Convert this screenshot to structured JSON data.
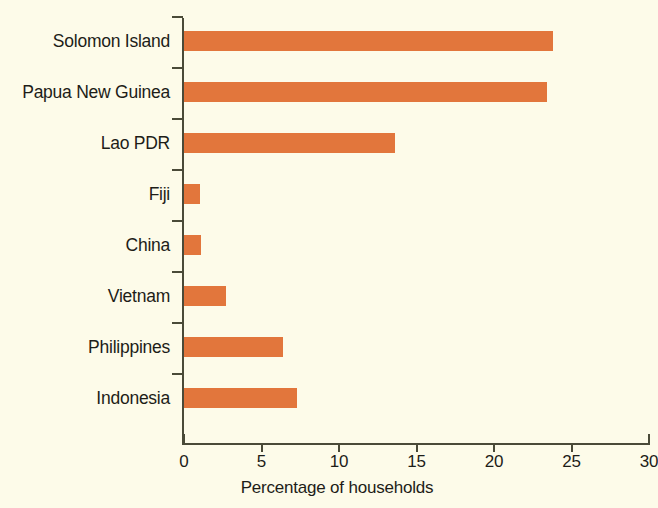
{
  "chart_data": {
    "type": "bar",
    "orientation": "horizontal",
    "title": "",
    "subtitle": "",
    "xlabel": "Percentage of households",
    "ylabel": "",
    "categories": [
      "Solomon Island",
      "Papua New Guinea",
      "Lao PDR",
      "Fiji",
      "China",
      "Vietnam",
      "Philippines",
      "Indonesia"
    ],
    "values": [
      23.8,
      23.4,
      13.6,
      1.0,
      1.1,
      2.7,
      6.4,
      7.3
    ],
    "xlim": [
      0,
      30
    ],
    "xticks": [
      0,
      5,
      10,
      15,
      20,
      25,
      30
    ],
    "xtick_labels": [
      "0",
      "5",
      "10",
      "15",
      "20",
      "25",
      "30"
    ],
    "grid": false,
    "legend": null,
    "bar_color": "#e2763c",
    "background_color": "#fdfbe9",
    "axis_color": "#4a4a38",
    "text_color": "#1d1d18"
  }
}
